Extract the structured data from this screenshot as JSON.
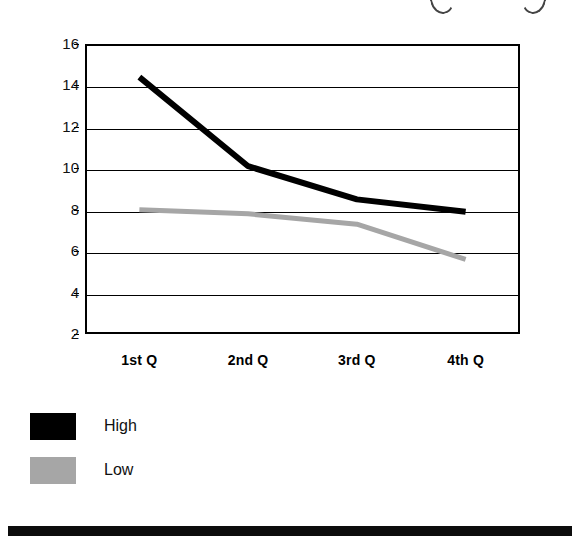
{
  "chart_data": {
    "type": "line",
    "title": "",
    "subtitle": "",
    "xlabel": "",
    "ylabel": "",
    "categories": [
      "1st Q",
      "2nd Q",
      "3rd Q",
      "4th Q"
    ],
    "series": [
      {
        "name": "High",
        "color": "#000000",
        "values": [
          14.4,
          10.1,
          8.5,
          7.9
        ]
      },
      {
        "name": "Low",
        "color": "#a6a6a6",
        "values": [
          8.0,
          7.8,
          7.3,
          5.6
        ]
      }
    ],
    "yticks": [
      16,
      14,
      12,
      10,
      8,
      6,
      4,
      2
    ],
    "ylim": [
      2,
      16
    ],
    "grid": true,
    "grid_axis": "y",
    "legend_position": "below-left",
    "legend": [
      "High",
      "Low"
    ]
  },
  "axes": {
    "y_tick_labels": [
      "16",
      "14",
      "12",
      "10",
      "8",
      "6",
      "4",
      "2"
    ],
    "x_tick_labels": [
      "1st Q",
      "2nd Q",
      "3rd Q",
      "4th Q"
    ]
  },
  "legend": {
    "items": [
      {
        "label": "High",
        "color": "#000000"
      },
      {
        "label": "Low",
        "color": "#a6a6a6"
      }
    ]
  },
  "colors": {
    "high_series": "#000000",
    "low_series": "#a6a6a6",
    "axis": "#000000",
    "background": "#ffffff",
    "bottom_bar": "#0d0d0d"
  }
}
